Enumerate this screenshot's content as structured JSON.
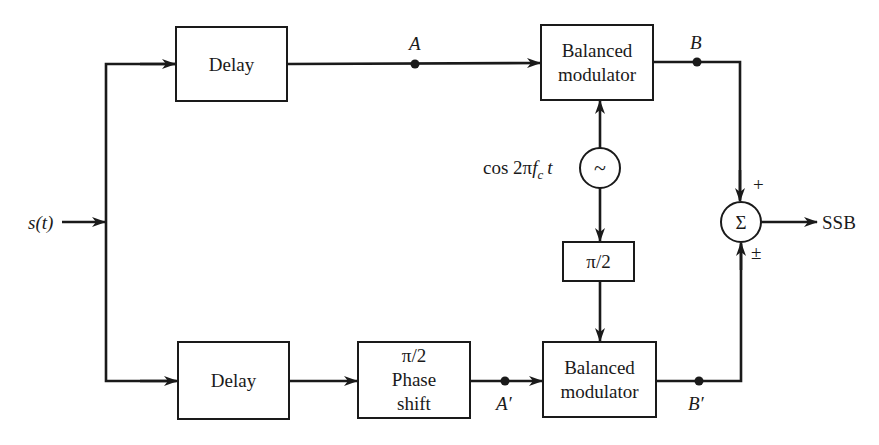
{
  "diagram": {
    "type": "block-diagram",
    "input_label": "s(t)",
    "output_label": "SSB",
    "blocks": {
      "delay_top": "Delay",
      "delay_bottom": "Delay",
      "modulator_top": [
        "Balanced",
        "modulator"
      ],
      "modulator_bottom": [
        "Balanced",
        "modulator"
      ],
      "phase_shift_signal": [
        "π/2",
        "Phase",
        "shift"
      ],
      "phase_shift_carrier": "π/2",
      "oscillator_symbol": "~",
      "summer_symbol": "Σ"
    },
    "carrier_label": {
      "prefix": "cos 2π",
      "f": "f",
      "sub": "c",
      "t": "t"
    },
    "nodes": {
      "A": "A",
      "B": "B",
      "A_prime": "A′",
      "B_prime": "B′"
    },
    "summer_signs": {
      "top": "+",
      "bottom": "±"
    },
    "colors": {
      "ink": "#1a1a1a",
      "background": "#ffffff"
    }
  }
}
